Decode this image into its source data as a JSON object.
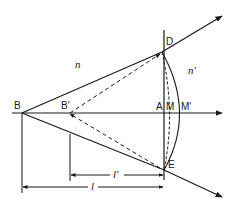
{
  "diagram": {
    "type": "refraction-at-spherical-surface",
    "labels": {
      "B": "B",
      "B_prime": "B′",
      "A": "A",
      "M": "M",
      "M_prime": "M′",
      "D": "D",
      "E": "E",
      "n": "n",
      "n_prime": "n′",
      "l": "l",
      "l_prime": "l′"
    },
    "colors": {
      "stroke": "#1a1a1a",
      "background": "#ffffff"
    }
  }
}
